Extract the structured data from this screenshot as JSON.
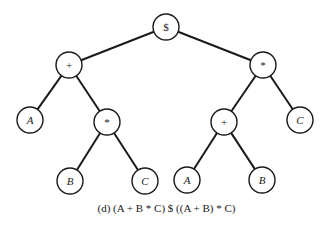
{
  "diagram": {
    "type": "expression-tree",
    "caption": "(d) (A + B * C) $ ((A + B) * C)",
    "nodes": [
      {
        "id": "root",
        "label": "$",
        "kind": "operator",
        "x": 166,
        "y": 27
      },
      {
        "id": "plus_l",
        "label": "+",
        "kind": "operator",
        "x": 69,
        "y": 65
      },
      {
        "id": "times_r",
        "label": "*",
        "kind": "operator",
        "x": 263,
        "y": 65
      },
      {
        "id": "a_l",
        "label": "A",
        "kind": "operand",
        "x": 30,
        "y": 120
      },
      {
        "id": "times_l",
        "label": "*",
        "kind": "operator",
        "x": 107,
        "y": 122
      },
      {
        "id": "plus_r",
        "label": "+",
        "kind": "operator",
        "x": 224,
        "y": 122
      },
      {
        "id": "c_r",
        "label": "C",
        "kind": "operand",
        "x": 300,
        "y": 120
      },
      {
        "id": "b_l",
        "label": "B",
        "kind": "operand",
        "x": 70,
        "y": 181
      },
      {
        "id": "c_l",
        "label": "C",
        "kind": "operand",
        "x": 145,
        "y": 181
      },
      {
        "id": "a_r",
        "label": "A",
        "kind": "operand",
        "x": 187,
        "y": 180
      },
      {
        "id": "b_r",
        "label": "B",
        "kind": "operand",
        "x": 262,
        "y": 180
      }
    ],
    "edges": [
      {
        "from": "root",
        "to": "plus_l"
      },
      {
        "from": "root",
        "to": "times_r"
      },
      {
        "from": "plus_l",
        "to": "a_l"
      },
      {
        "from": "plus_l",
        "to": "times_l"
      },
      {
        "from": "times_l",
        "to": "b_l"
      },
      {
        "from": "times_l",
        "to": "c_l"
      },
      {
        "from": "times_r",
        "to": "plus_r"
      },
      {
        "from": "times_r",
        "to": "c_r"
      },
      {
        "from": "plus_r",
        "to": "a_r"
      },
      {
        "from": "plus_r",
        "to": "b_r"
      }
    ],
    "node_radius": 13,
    "colors": {
      "stroke": "#1a1a1a",
      "fill": "#ffffff",
      "background": "#ffffff"
    }
  }
}
